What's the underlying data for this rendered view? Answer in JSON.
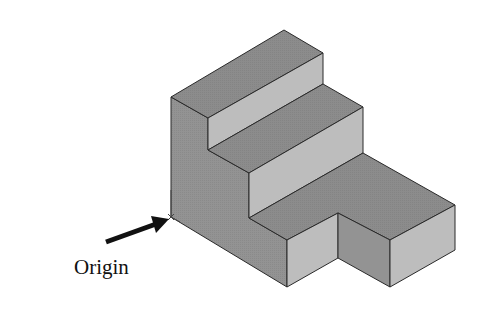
{
  "figure": {
    "type": "isometric-stepped-block",
    "annotation": {
      "label": "Origin"
    },
    "colors": {
      "top_face": "#8c8c8c",
      "riser_face": "#bdbdbd",
      "side_face": "#939393",
      "edge": "#2a2a2a",
      "arrow": "#111111"
    }
  }
}
